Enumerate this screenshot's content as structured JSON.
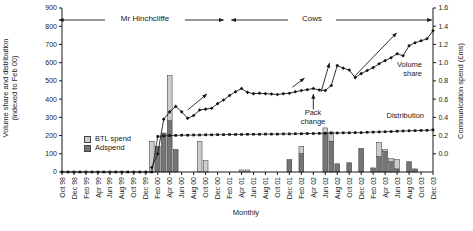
{
  "figure": {
    "background": "#ffffff",
    "axis_color": "#1a1a1a"
  },
  "chart_data": {
    "type": "combo-bar-line",
    "months_total": 63,
    "x_axis": {
      "title": "Monthly",
      "tick_every_months": 2,
      "tick_labels": [
        "Oct 98",
        "Dec 98",
        "Feb 99",
        "Apr 99",
        "Jun 99",
        "Aug 99",
        "Oct 99",
        "Dec 99",
        "Feb 00",
        "Apr 00",
        "Jun 00",
        "Aug 00",
        "Oct 00",
        "Dec 00",
        "Feb 01",
        "Apr 01",
        "Jun 01",
        "Aug 01",
        "Oct 01",
        "Dec 01",
        "Feb 02",
        "Apr 02",
        "Jun 02",
        "Aug 02",
        "Oct 02",
        "Dec 02",
        "Feb 03",
        "Apr 03",
        "Jun 03",
        "Aug 03",
        "Oct 03",
        "Dec 03"
      ]
    },
    "left_axis": {
      "title_line1": "Volume share and distribution",
      "title_line2": "(indexed to Feb 00)",
      "min": 0,
      "max": 900,
      "step": 100,
      "tick_labels": [
        "900",
        "800",
        "700",
        "600",
        "500",
        "400",
        "300",
        "200",
        "100",
        "0"
      ]
    },
    "right_axis": {
      "title": "Communication spend (£ms)",
      "min": 0,
      "max": 1.6,
      "step": 0.2,
      "tick_labels": [
        "1.6",
        "1.4",
        "1.2",
        "1.0",
        "0.8",
        "0.6",
        "0.4",
        "0.2",
        "0.0"
      ]
    },
    "series": [
      {
        "name": "Volume share",
        "type": "line",
        "axis": "left",
        "marker": "diamond",
        "color": "#1a1a1a",
        "start_month": 15,
        "values": [
          25,
          100,
          290,
          330,
          360,
          330,
          295,
          310,
          340,
          345,
          350,
          375,
          395,
          420,
          440,
          458,
          437,
          430,
          432,
          430,
          428,
          425,
          430,
          432,
          440,
          447,
          452,
          458,
          450,
          447,
          475,
          584,
          570,
          560,
          518,
          540,
          557,
          573,
          594,
          611,
          627,
          649,
          638,
          693,
          709,
          720,
          731,
          775
        ]
      },
      {
        "name": "Distribution",
        "type": "line",
        "axis": "left",
        "marker": "square",
        "color": "#1a1a1a",
        "start_month": 0,
        "values": [
          0,
          0,
          0,
          0,
          0,
          0,
          0,
          0,
          0,
          0,
          0,
          0,
          0,
          0,
          0,
          0,
          195,
          198,
          200,
          201,
          202,
          202,
          203,
          203,
          204,
          204,
          205,
          205,
          206,
          206,
          206,
          207,
          207,
          207,
          208,
          208,
          208,
          209,
          209,
          210,
          210,
          211,
          211,
          212,
          213,
          214,
          214,
          215,
          215,
          216,
          216,
          218,
          219,
          220,
          221,
          222,
          224,
          225,
          226,
          227,
          228,
          229,
          231
        ]
      },
      {
        "name": "Adspend",
        "type": "bar",
        "axis": "right",
        "color": "#757575",
        "start_month": 0,
        "values": [
          0,
          0,
          0,
          0,
          0,
          0,
          0,
          0,
          0,
          0,
          0,
          0,
          0,
          0,
          0,
          0,
          0.25,
          0.38,
          0.5,
          0.22,
          0,
          0,
          0,
          0,
          0,
          0,
          0,
          0,
          0,
          0,
          0,
          0,
          0,
          0,
          0,
          0,
          0,
          0,
          0.12,
          0,
          0.18,
          0,
          0,
          0,
          0.38,
          0.3,
          0.08,
          0,
          0.09,
          0,
          0.23,
          0,
          0.04,
          0.15,
          0.2,
          0.1,
          0.03,
          0,
          0.1,
          0.03,
          0,
          0,
          0
        ]
      },
      {
        "name": "BTL spend",
        "type": "bar",
        "axis": "right",
        "color": "#cccccc",
        "start_month": 0,
        "values": [
          0,
          0,
          0,
          0,
          0,
          0,
          0,
          0,
          0,
          0,
          0,
          0,
          0,
          0,
          0,
          0.3,
          0,
          0,
          0.44,
          0,
          0,
          0,
          0,
          0.3,
          0.11,
          0,
          0,
          0,
          0,
          0,
          0.02,
          0.02,
          0,
          0,
          0,
          0,
          0,
          0,
          0,
          0,
          0.07,
          0,
          0,
          0,
          0.05,
          0.09,
          0,
          0,
          0,
          0,
          0,
          0,
          0,
          0.14,
          0.02,
          0.03,
          0.09,
          0,
          0,
          0,
          0,
          0,
          0
        ]
      }
    ],
    "legend": [
      {
        "label": "BTL spend",
        "color": "#cccccc"
      },
      {
        "label": "Adspend",
        "color": "#757575"
      }
    ],
    "annotations": {
      "campaign_spans": [
        {
          "label": "Mr Hinchcliffe",
          "from_month": -0.5,
          "to_month": 27.0
        },
        {
          "label": "Cows",
          "from_month": 28.3,
          "to_month": 61.8
        }
      ],
      "pack_change": {
        "label_line1": "Pack",
        "label_line2": "change",
        "month": 42,
        "arrow_from_value": 343,
        "arrow_to_value": 427
      },
      "volume_share_label": {
        "line1": "Volume",
        "line2": "share"
      },
      "distribution_label": {
        "text": "Distribution"
      },
      "trend_arrows": [
        {
          "from_month": 21.0,
          "from_value": 340,
          "to_month": 24.2,
          "to_value": 428
        },
        {
          "from_month": 38.5,
          "from_value": 465,
          "to_month": 40.5,
          "to_value": 515
        },
        {
          "from_month": 43.3,
          "from_value": 440,
          "to_month": 44.7,
          "to_value": 598
        },
        {
          "from_month": 48.8,
          "from_value": 522,
          "to_month": 55.9,
          "to_value": 763
        }
      ]
    }
  }
}
